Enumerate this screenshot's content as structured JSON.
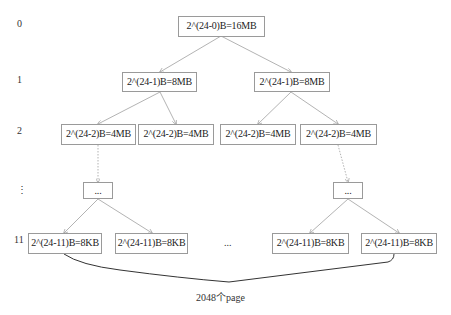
{
  "diagram": {
    "levels": [
      {
        "label": "0",
        "nodes": [
          "2^(24-0)B=16MB"
        ]
      },
      {
        "label": "1",
        "nodes": [
          "2^(24-1)B=8MB",
          "2^(24-1)B=8MB"
        ]
      },
      {
        "label": "2",
        "nodes": [
          "2^(24-2)B=4MB",
          "2^(24-2)B=4MB",
          "2^(24-2)B=4MB",
          "2^(24-2)B=4MB"
        ]
      },
      {
        "label": "⋮",
        "nodes": [
          "...",
          "..."
        ]
      },
      {
        "label": "11",
        "nodes": [
          "2^(24-11)B=8KB",
          "2^(24-11)B=8KB",
          "2^(24-11)B=8KB",
          "2^(24-11)B=8KB"
        ]
      }
    ],
    "gap_ellipsis": "...",
    "brace_label": "2048个page",
    "colors": {
      "box_border": "#9a9a9a",
      "edge": "#999999",
      "brace": "#333333"
    }
  }
}
